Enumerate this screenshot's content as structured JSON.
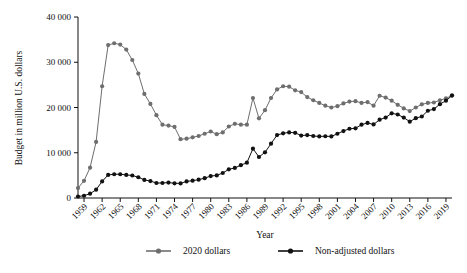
{
  "chart_data": {
    "type": "line",
    "title": "",
    "xlabel": "Year",
    "ylabel": "Budget in million U.S. dollars",
    "xlim": [
      1958,
      2020
    ],
    "ylim": [
      0,
      40000
    ],
    "grid": false,
    "legend_position": "bottom",
    "ytick_labels": [
      "0",
      "10 000",
      "20 000",
      "30 000",
      "40 000"
    ],
    "ytick_values": [
      0,
      10000,
      20000,
      30000,
      40000
    ],
    "xtick_labels": [
      "1959",
      "1962",
      "1965",
      "1968",
      "1971",
      "1974",
      "1977",
      "1980",
      "1983",
      "1986",
      "1989",
      "1992",
      "1995",
      "1998",
      "2001",
      "2004",
      "2007",
      "2010",
      "2013",
      "2016",
      "2019"
    ],
    "xtick_values": [
      1959,
      1962,
      1965,
      1968,
      1971,
      1974,
      1977,
      1980,
      1983,
      1986,
      1989,
      1992,
      1995,
      1998,
      2001,
      2004,
      2007,
      2010,
      2013,
      2016,
      2019
    ],
    "x": [
      1958,
      1959,
      1960,
      1961,
      1962,
      1963,
      1964,
      1965,
      1966,
      1967,
      1968,
      1969,
      1970,
      1971,
      1972,
      1973,
      1974,
      1975,
      1976,
      1977,
      1978,
      1979,
      1980,
      1981,
      1982,
      1983,
      1984,
      1985,
      1986,
      1987,
      1988,
      1989,
      1990,
      1991,
      1992,
      1993,
      1994,
      1995,
      1996,
      1997,
      1998,
      1999,
      2000,
      2001,
      2002,
      2003,
      2004,
      2005,
      2006,
      2007,
      2008,
      2009,
      2010,
      2011,
      2012,
      2013,
      2014,
      2015,
      2016,
      2017,
      2018,
      2019,
      2020
    ],
    "series": [
      {
        "name": "2020 dollars",
        "color": "#6e6e6e",
        "marker": "circle",
        "values": [
          2200,
          3800,
          6700,
          12400,
          24700,
          33800,
          34200,
          33900,
          32800,
          30500,
          27500,
          23000,
          20800,
          18300,
          16200,
          16000,
          15700,
          13000,
          13100,
          13400,
          13700,
          14200,
          14700,
          14100,
          14500,
          15800,
          16400,
          16200,
          16200,
          22100,
          17600,
          19400,
          22100,
          24000,
          24700,
          24600,
          23800,
          23400,
          22300,
          21600,
          21000,
          20400,
          20000,
          20300,
          20900,
          21300,
          21400,
          21000,
          21200,
          20400,
          22600,
          22200,
          21500,
          20600,
          19800,
          19200,
          20000,
          20700,
          21000,
          21100,
          21600,
          22000,
          22700
        ]
      },
      {
        "name": "Non-adjusted dollars",
        "color": "#111111",
        "marker": "circle",
        "values": [
          330,
          500,
          960,
          1830,
          3670,
          5100,
          5250,
          5250,
          5100,
          4970,
          4590,
          3990,
          3750,
          3310,
          3310,
          3410,
          3250,
          3230,
          3670,
          3820,
          4060,
          4380,
          4850,
          4990,
          5530,
          6330,
          6650,
          7250,
          7800,
          10900,
          9060,
          10100,
          12000,
          13900,
          14300,
          14500,
          14400,
          13800,
          13900,
          13700,
          13600,
          13650,
          13600,
          14200,
          14800,
          15300,
          15400,
          16200,
          16600,
          16250,
          17300,
          17780,
          18720,
          18450,
          17770,
          16870,
          17650,
          18010,
          19280,
          19650,
          20740,
          21500,
          22630
        ]
      }
    ]
  },
  "legend": {
    "items": [
      {
        "label": "2020 dollars",
        "color": "#6e6e6e"
      },
      {
        "label": "Non-adjusted dollars",
        "color": "#111111"
      }
    ]
  },
  "axes": {
    "y_title": "Budget in million U.S. dollars",
    "x_title": "Year"
  }
}
